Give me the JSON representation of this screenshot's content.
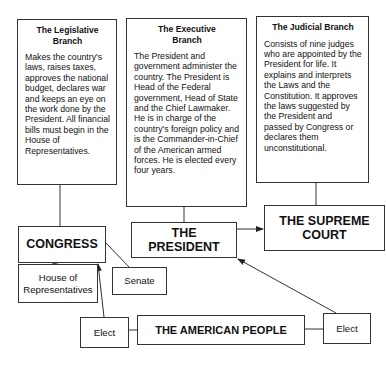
{
  "branches": {
    "legislative": {
      "title": "The Legislative Branch",
      "body": "Makes the country's laws, raises taxes, approves the national budget, declares war and keeps an eye on the work done by the President. All financial bills must begin in the House of Representatives."
    },
    "executive": {
      "title": "The Executive Branch",
      "body": "The President and government administer the country. The President is Head of the Federal government, Head of State and the Chief Lawmaker. He is in charge of the country's foreign policy and is the Commander-in-Chief of the American armed forces. He is elected every four years."
    },
    "judicial": {
      "title": "The Judicial Branch",
      "body": "Consists of nine judges who are appointed by the President for life. It explains and interprets the Laws and the Constitution. It approves the laws suggested by the President and passed by Congress or declares them unconstitutional."
    }
  },
  "institutions": {
    "congress": "CONGRESS",
    "president": "THE PRESIDENT",
    "supreme_court": "THE SUPREME COURT",
    "house": "House of Representatives",
    "senate": "Senate"
  },
  "people": {
    "label": "THE AMERICAN PEOPLE",
    "elect_left": "Elect",
    "elect_right": "Elect"
  }
}
